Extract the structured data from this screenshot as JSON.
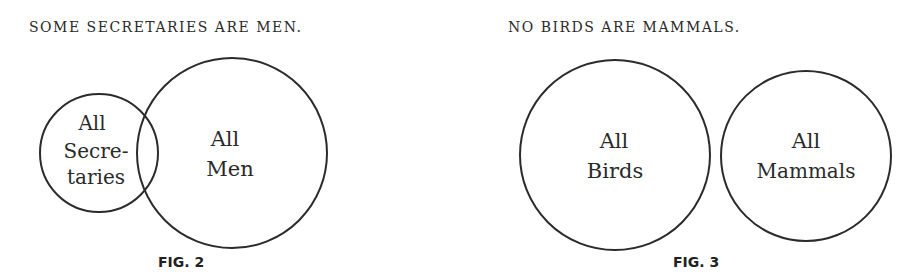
{
  "figures": [
    {
      "caption": "FIG. 2",
      "title": "SOME SECRETARIES ARE MEN.",
      "circles": [
        {
          "label_line1": "All",
          "label_line2": "Secre-",
          "label_line3": "taries",
          "cx": 99,
          "cy": 153,
          "r": 59
        },
        {
          "label_line1": "All",
          "label_line2": "Men",
          "cx": 232,
          "cy": 153,
          "r": 95
        }
      ],
      "relationship": "overlap"
    },
    {
      "caption": "FIG. 3",
      "title": "NO BIRDS ARE MAMMALS.",
      "circles": [
        {
          "label_line1": "All",
          "label_line2": "Birds",
          "cx": 615,
          "cy": 155,
          "r": 95
        },
        {
          "label_line1": "All",
          "label_line2": "Mammals",
          "cx": 806,
          "cy": 156,
          "r": 85
        }
      ],
      "relationship": "disjoint"
    }
  ],
  "colors": {
    "stroke": "#2b2b2b",
    "text": "#2a2a2a",
    "background": "#ffffff"
  }
}
